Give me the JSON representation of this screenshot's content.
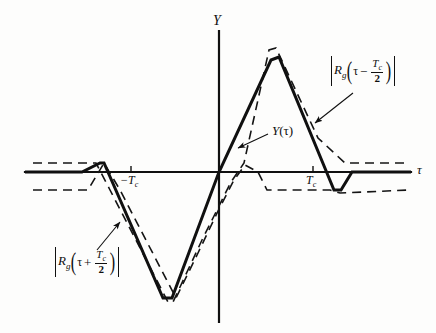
{
  "figure": {
    "background_color": "#fdfdfc",
    "ink_color": "#101010",
    "width": 436,
    "height": 333
  },
  "axes": {
    "y_axis_label": "Y",
    "x_axis_label": "τ",
    "origin_px": {
      "x": 219,
      "y": 172
    },
    "x_axis_extent_px": {
      "x1": 25,
      "x2": 411
    },
    "y_axis_extent_px": {
      "y1": 31,
      "y2": 322
    },
    "ticks": [
      {
        "label": "−T",
        "sub": "c",
        "value": "-Tc",
        "x_px": 131
      },
      {
        "label": "T",
        "sub": "c",
        "value": "Tc",
        "x_px": 313
      }
    ]
  },
  "labels": {
    "solid_curve": {
      "main": "Y",
      "arg": "(τ)"
    },
    "dashed_left": {
      "abs_open": "|",
      "func": "R",
      "func_sub": "g",
      "paren_open": "(",
      "var": "τ",
      "op": "+",
      "frac_num": "T",
      "frac_num_sub": "c",
      "frac_den": "2",
      "paren_close": ")",
      "abs_close": "|"
    },
    "dashed_right": {
      "abs_open": "|",
      "func": "R",
      "func_sub": "g",
      "paren_open": "(",
      "var": "τ",
      "op": "−",
      "frac_num": "T",
      "frac_num_sub": "c",
      "frac_den": "2",
      "paren_close": ")",
      "abs_close": "|"
    }
  },
  "chart_data": {
    "type": "line",
    "title": "",
    "xlabel": "τ",
    "ylabel": "Y",
    "grid": false,
    "legend": "annotations",
    "axis_pixel_origin": {
      "x": 219,
      "y": 172
    },
    "series": [
      {
        "name": "Y(τ)",
        "style": "solid",
        "linewidth": 3,
        "points_px": [
          {
            "x": 25,
            "y": 172
          },
          {
            "x": 82,
            "y": 172
          },
          {
            "x": 100,
            "y": 163
          },
          {
            "x": 104,
            "y": 163
          },
          {
            "x": 163,
            "y": 298
          },
          {
            "x": 172,
            "y": 298
          },
          {
            "x": 219,
            "y": 172
          },
          {
            "x": 271,
            "y": 60
          },
          {
            "x": 279,
            "y": 57
          },
          {
            "x": 334,
            "y": 190
          },
          {
            "x": 341,
            "y": 190
          },
          {
            "x": 352,
            "y": 172
          },
          {
            "x": 411,
            "y": 172
          }
        ]
      },
      {
        "name": "|R_g(τ + T_c/2)|",
        "style": "dashed",
        "linewidth": 1.6,
        "points_px": [
          {
            "x": 33,
            "y": 163
          },
          {
            "x": 96,
            "y": 163
          },
          {
            "x": 110,
            "y": 190
          },
          {
            "x": 168,
            "y": 302
          },
          {
            "x": 173,
            "y": 302
          },
          {
            "x": 202,
            "y": 240
          },
          {
            "x": 231,
            "y": 182
          },
          {
            "x": 244,
            "y": 163
          },
          {
            "x": 269,
            "y": 50
          },
          {
            "x": 276,
            "y": 48
          },
          {
            "x": 318,
            "y": 138
          },
          {
            "x": 345,
            "y": 163
          },
          {
            "x": 355,
            "y": 163
          },
          {
            "x": 410,
            "y": 163
          }
        ]
      },
      {
        "name": "|R_g(τ − T_c/2)| (lower branch)",
        "style": "dashed",
        "linewidth": 1.6,
        "points_px": [
          {
            "x": 33,
            "y": 190
          },
          {
            "x": 88,
            "y": 190
          },
          {
            "x": 104,
            "y": 163
          },
          {
            "x": 120,
            "y": 190
          },
          {
            "x": 176,
            "y": 298
          },
          {
            "x": 198,
            "y": 253
          },
          {
            "x": 219,
            "y": 209
          },
          {
            "x": 234,
            "y": 180
          },
          {
            "x": 245,
            "y": 165
          },
          {
            "x": 258,
            "y": 172
          },
          {
            "x": 267,
            "y": 190
          },
          {
            "x": 330,
            "y": 190
          },
          {
            "x": 340,
            "y": 193
          },
          {
            "x": 410,
            "y": 190
          }
        ]
      }
    ],
    "annotations": [
      {
        "text": "Y(τ)",
        "label_px": {
          "x": 272,
          "y": 131
        },
        "arrow_from_px": {
          "x": 268,
          "y": 134
        },
        "arrow_to_px": {
          "x": 238,
          "y": 148
        }
      },
      {
        "text": "|R_g(τ − T_c/2)|",
        "label_px": {
          "x": 331,
          "y": 72
        },
        "arrow_from_px": {
          "x": 353,
          "y": 93
        },
        "arrow_to_px": {
          "x": 315,
          "y": 123
        }
      },
      {
        "text": "|R_g(τ + T_c/2)|",
        "label_px": {
          "x": 56,
          "y": 262
        },
        "arrow_from_px": {
          "x": 97,
          "y": 250
        },
        "arrow_to_px": {
          "x": 120,
          "y": 222
        }
      }
    ]
  }
}
